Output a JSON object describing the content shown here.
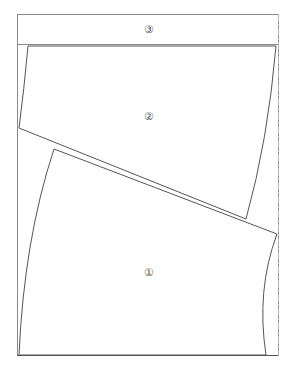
{
  "diagram": {
    "type": "pattern-layout",
    "colors": {
      "frame": "#8a8a8a",
      "piece": "#555555",
      "fold_line": "#b5b5b5"
    },
    "pieces": [
      {
        "id": "1",
        "label": "①",
        "x": 149,
        "y": 272
      },
      {
        "id": "2",
        "label": "②",
        "x": 149,
        "y": 116
      },
      {
        "id": "3",
        "label": "③",
        "x": 149,
        "y": 29
      }
    ]
  }
}
